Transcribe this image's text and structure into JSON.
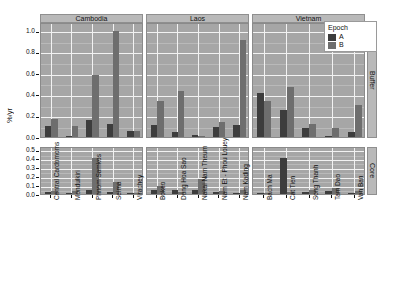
{
  "chart_data": {
    "type": "bar",
    "title": "",
    "xlabel": "",
    "ylabel": "%/yr",
    "grid": true,
    "legend": {
      "title": "Epoch",
      "position": "top-right",
      "entries": [
        {
          "name": "A",
          "color": "#3d3d3d"
        },
        {
          "name": "B",
          "color": "#6e6e6e"
        }
      ]
    },
    "column_strips": [
      "Cambodia",
      "Laos",
      "Vietnam"
    ],
    "row_strips": [
      "Buffer",
      "Core"
    ],
    "rows": [
      {
        "strip": "Buffer",
        "ylim": [
          0,
          1.08
        ],
        "yticks": [
          "0.0",
          "0.2",
          "0.4",
          "0.6",
          "0.8",
          "1.0"
        ],
        "ytick_values": [
          0.0,
          0.2,
          0.4,
          0.6,
          0.8,
          1.0
        ],
        "panels": [
          {
            "strip": "Cambodia",
            "categories": [
              "Central Cardomoms",
              "Mondulkiri",
              "Phnom Samkos",
              "Seima",
              "Virachey"
            ],
            "series": [
              {
                "name": "A",
                "values": [
                  0.1,
                  0.01,
                  0.16,
                  0.12,
                  0.06
                ]
              },
              {
                "name": "B",
                "values": [
                  0.17,
                  0.1,
                  0.58,
                  1.0,
                  0.06
                ]
              }
            ]
          },
          {
            "strip": "Laos",
            "categories": [
              "Bokeo",
              "Dong Hoa Sao",
              "Nakai Nam Theum",
              "Nam Et - Phou Louey",
              "Nam Kading"
            ],
            "series": [
              {
                "name": "A",
                "values": [
                  0.11,
                  0.05,
                  0.02,
                  0.09,
                  0.11
                ]
              },
              {
                "name": "B",
                "values": [
                  0.34,
                  0.43,
                  0.01,
                  0.14,
                  0.91
                ]
              }
            ]
          },
          {
            "strip": "Vietnam",
            "categories": [
              "Bach Ma",
              "Cat Tien",
              "Song Thanh",
              "Tam Dao",
              "Van Ban"
            ],
            "values_note": "",
            "series": [
              {
                "name": "A",
                "values": [
                  0.41,
                  0.25,
                  0.08,
                  0.01,
                  0.05
                ]
              },
              {
                "name": "B",
                "values": [
                  0.34,
                  0.47,
                  0.12,
                  0.08,
                  0.3
                ]
              }
            ]
          }
        ]
      },
      {
        "strip": "Core",
        "ylim": [
          0,
          0.54
        ],
        "yticks": [
          "0.0",
          "0.1",
          "0.2",
          "0.3",
          "0.4",
          "0.5"
        ],
        "ytick_values": [
          0.0,
          0.1,
          0.2,
          0.3,
          0.4,
          0.5
        ],
        "panels": [
          {
            "strip": "Cambodia",
            "categories": [
              "Central Cardomoms",
              "Mondulkiri",
              "Phnom Samkos",
              "Seima",
              "Virachey"
            ],
            "series": [
              {
                "name": "A",
                "values": [
                  0.02,
                  0.01,
                  0.04,
                  0.02,
                  0.0
                ]
              },
              {
                "name": "B",
                "values": [
                  0.03,
                  0.03,
                  0.4,
                  0.13,
                  0.01
                ]
              }
            ]
          },
          {
            "strip": "Laos",
            "categories": [
              "Bokeo",
              "Dong Hoa Sao",
              "Nakai Nam Theum",
              "Nam Et - Phou Louey",
              "Nam Kading"
            ],
            "series": [
              {
                "name": "A",
                "values": [
                  0.04,
                  0.05,
                  0.04,
                  0.02,
                  0.01
                ]
              },
              {
                "name": "B",
                "values": [
                  0.09,
                  0.02,
                  0.17,
                  0.03,
                  0.04
                ]
              }
            ]
          },
          {
            "strip": "Vietnam",
            "categories": [
              "Bach Ma",
              "Cat Tien",
              "Song Thanh",
              "Tam Dao",
              "Van Ban"
            ],
            "series": [
              {
                "name": "A",
                "values": [
                  0.01,
                  0.4,
                  0.02,
                  0.03,
                  0.0
                ]
              },
              {
                "name": "B",
                "values": [
                  0.01,
                  0.02,
                  0.05,
                  0.07,
                  0.03
                ]
              }
            ]
          }
        ]
      }
    ]
  }
}
